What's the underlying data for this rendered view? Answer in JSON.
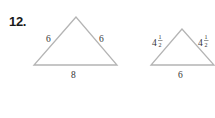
{
  "problem": {
    "number": "12.",
    "triangles": [
      {
        "name": "large",
        "sides": {
          "left": "6",
          "right": "6",
          "base": "8"
        }
      },
      {
        "name": "small",
        "sides": {
          "left": {
            "whole": "4",
            "num": "1",
            "den": "2"
          },
          "right": {
            "whole": "4",
            "num": "1",
            "den": "2"
          },
          "base": "6"
        }
      }
    ]
  },
  "colors": {
    "line": "#b4b4b4",
    "text": "#333333"
  }
}
